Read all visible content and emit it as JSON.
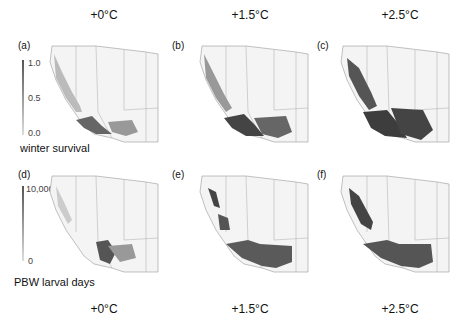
{
  "figure": {
    "top_titles": [
      "+0°C",
      "+1.5°C",
      "+2.5°C"
    ],
    "bottom_titles": [
      "+0°C",
      "+1.5°C",
      "+2.5°C"
    ],
    "panels": [
      {
        "label": "(a)",
        "row": "winter survival",
        "warming": "+0°C"
      },
      {
        "label": "(b)",
        "row": "winter survival",
        "warming": "+1.5°C"
      },
      {
        "label": "(c)",
        "row": "winter survival",
        "warming": "+2.5°C"
      },
      {
        "label": "(d)",
        "row": "PBW larval days",
        "warming": "+0°C"
      },
      {
        "label": "(e)",
        "row": "PBW larval days",
        "warming": "+1.5°C"
      },
      {
        "label": "(f)",
        "row": "PBW larval days",
        "warming": "+2.5°C"
      }
    ],
    "legend_top": {
      "title": "winter survival",
      "max": "1.0",
      "mid": "0.5",
      "min": "0.0"
    },
    "legend_bottom": {
      "title": "PBW larval days",
      "max": "10,000",
      "min": "0"
    },
    "colors": {
      "low": "#f2f2f2",
      "high": "#3a3a3a",
      "outline": "#9a9a9a"
    }
  }
}
